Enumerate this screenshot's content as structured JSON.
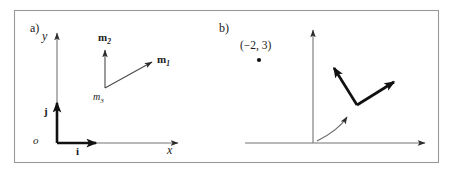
{
  "figure": {
    "border_color": "#9a9a9a",
    "ink_color": "#1a1a1a",
    "thin_line_color": "#757575",
    "background": "#ffffff"
  },
  "panel_a": {
    "tag": "a)",
    "axis_x_label": "x",
    "axis_y_label": "y",
    "origin_label": "o",
    "basis_i_label": "i",
    "basis_j_label": "j",
    "m_frame": {
      "m1_label": "m",
      "m1_sub": "1",
      "m2_label": "m",
      "m2_sub": "2",
      "m3_label": "m",
      "m3_sub": "3"
    }
  },
  "panel_b": {
    "tag": "b)",
    "point_label": "(−2, 3)",
    "point_x": -2,
    "point_y": 3
  }
}
